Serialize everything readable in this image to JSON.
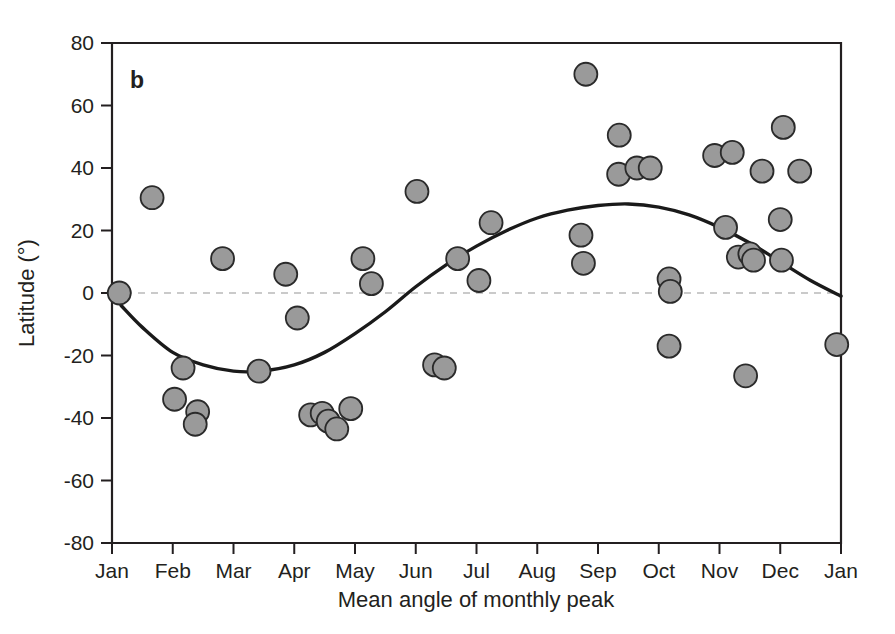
{
  "panel": {
    "label": "b"
  },
  "axes": {
    "y_title": "Latitude (°)",
    "x_title": "Mean angle of monthly peak",
    "y_ticks": [
      "80",
      "60",
      "40",
      "20",
      "0",
      "-20",
      "-40",
      "-60",
      "-80"
    ],
    "x_ticks": [
      "Jan",
      "Feb",
      "Mar",
      "Apr",
      "May",
      "Jun",
      "Jul",
      "Aug",
      "Sep",
      "Oct",
      "Nov",
      "Dec",
      "Jan"
    ]
  },
  "colors": {
    "marker_fill": "#9a9a9a",
    "marker_stroke": "#2a2a2a",
    "curve": "#1a1a1a",
    "axis": "#231f20",
    "zero_line": "#b9b9b9",
    "background": "#ffffff"
  },
  "chart_data": {
    "type": "scatter",
    "title": "",
    "subtitle": "",
    "xlabel": "Mean angle of monthly peak",
    "ylabel": "Latitude (°)",
    "xlim": [
      0,
      12
    ],
    "ylim": [
      -80,
      80
    ],
    "x_tick_values": [
      0,
      1,
      2,
      3,
      4,
      5,
      6,
      7,
      8,
      9,
      10,
      11,
      12
    ],
    "x_tick_labels": [
      "Jan",
      "Feb",
      "Mar",
      "Apr",
      "May",
      "Jun",
      "Jul",
      "Aug",
      "Sep",
      "Oct",
      "Nov",
      "Dec",
      "Jan"
    ],
    "y_tick_values": [
      80,
      60,
      40,
      20,
      0,
      -20,
      -40,
      -60,
      -80
    ],
    "grid": false,
    "legend": false,
    "annotations": [
      {
        "text": "b",
        "x": 0.33,
        "y": 70,
        "style": "bold panel label"
      }
    ],
    "reference_lines": [
      {
        "orientation": "horizontal",
        "y": 0,
        "style": "dashed",
        "color": "#b9b9b9"
      }
    ],
    "series": [
      {
        "name": "Monthly peak timing vs latitude",
        "marker": "filled circle",
        "color": "#9a9a9a",
        "points": [
          {
            "x": 0.12,
            "y": 0
          },
          {
            "x": 0.66,
            "y": 30.5
          },
          {
            "x": 1.17,
            "y": -24
          },
          {
            "x": 1.03,
            "y": -34
          },
          {
            "x": 1.41,
            "y": -38
          },
          {
            "x": 1.37,
            "y": -42
          },
          {
            "x": 1.82,
            "y": 11
          },
          {
            "x": 2.42,
            "y": -25
          },
          {
            "x": 2.86,
            "y": 6
          },
          {
            "x": 3.05,
            "y": -8
          },
          {
            "x": 3.27,
            "y": -39
          },
          {
            "x": 3.46,
            "y": -38.5
          },
          {
            "x": 3.56,
            "y": -41
          },
          {
            "x": 3.7,
            "y": -43.5
          },
          {
            "x": 3.93,
            "y": -37
          },
          {
            "x": 4.13,
            "y": 11
          },
          {
            "x": 4.27,
            "y": 3
          },
          {
            "x": 5.02,
            "y": 32.5
          },
          {
            "x": 5.31,
            "y": -23
          },
          {
            "x": 5.47,
            "y": -24
          },
          {
            "x": 5.69,
            "y": 11
          },
          {
            "x": 6.04,
            "y": 4
          },
          {
            "x": 6.24,
            "y": 22.5
          },
          {
            "x": 7.72,
            "y": 18.5
          },
          {
            "x": 7.76,
            "y": 9.5
          },
          {
            "x": 7.8,
            "y": 70
          },
          {
            "x": 8.35,
            "y": 50.5
          },
          {
            "x": 8.34,
            "y": 38
          },
          {
            "x": 8.64,
            "y": 40
          },
          {
            "x": 8.86,
            "y": 40
          },
          {
            "x": 9.17,
            "y": 4.5
          },
          {
            "x": 9.19,
            "y": 0.5
          },
          {
            "x": 9.17,
            "y": -17
          },
          {
            "x": 9.92,
            "y": 44
          },
          {
            "x": 10.21,
            "y": 45
          },
          {
            "x": 10.1,
            "y": 21
          },
          {
            "x": 10.31,
            "y": 11.5
          },
          {
            "x": 10.5,
            "y": 12.5
          },
          {
            "x": 10.56,
            "y": 10.5
          },
          {
            "x": 10.43,
            "y": -26.5
          },
          {
            "x": 10.7,
            "y": 39
          },
          {
            "x": 11.05,
            "y": 53
          },
          {
            "x": 11.0,
            "y": 23.5
          },
          {
            "x": 11.02,
            "y": 10.5
          },
          {
            "x": 11.32,
            "y": 39
          },
          {
            "x": 11.93,
            "y": -16.5
          }
        ]
      }
    ],
    "fit_curve": {
      "name": "sinusoidal fit",
      "color": "#1a1a1a",
      "description": "smooth sinusoid: minimum ~-25 at Mar, maximum ~+28 near Sep, crossing zero near Jan and near Jun/Jul",
      "points": [
        {
          "x": 0.15,
          "y": -4
        },
        {
          "x": 0.5,
          "y": -11
        },
        {
          "x": 1.0,
          "y": -19
        },
        {
          "x": 1.5,
          "y": -23
        },
        {
          "x": 2.0,
          "y": -25
        },
        {
          "x": 2.45,
          "y": -25
        },
        {
          "x": 3.0,
          "y": -23
        },
        {
          "x": 3.5,
          "y": -19
        },
        {
          "x": 4.0,
          "y": -13
        },
        {
          "x": 4.5,
          "y": -6
        },
        {
          "x": 5.0,
          "y": 2
        },
        {
          "x": 5.5,
          "y": 9
        },
        {
          "x": 6.0,
          "y": 15
        },
        {
          "x": 6.5,
          "y": 20
        },
        {
          "x": 7.0,
          "y": 24
        },
        {
          "x": 7.5,
          "y": 26.5
        },
        {
          "x": 8.0,
          "y": 28
        },
        {
          "x": 8.5,
          "y": 28.5
        },
        {
          "x": 9.0,
          "y": 27.5
        },
        {
          "x": 9.5,
          "y": 25
        },
        {
          "x": 10.0,
          "y": 21
        },
        {
          "x": 10.5,
          "y": 16
        },
        {
          "x": 11.0,
          "y": 10
        },
        {
          "x": 11.5,
          "y": 4
        },
        {
          "x": 12.0,
          "y": -1
        }
      ]
    }
  }
}
